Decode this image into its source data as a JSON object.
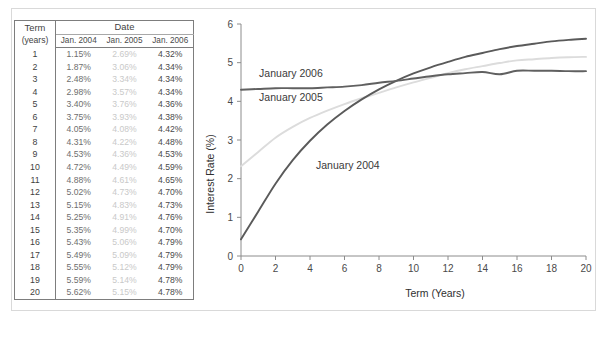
{
  "figure": {
    "border_color": "#d9d9d9",
    "background": "#ffffff"
  },
  "table": {
    "header": {
      "term_line1": "Term",
      "term_line2": "(years)",
      "date_group": "Date",
      "columns": [
        "Jan. 2004",
        "Jan. 2005",
        "Jan. 2006"
      ]
    },
    "rows": [
      {
        "term": "1",
        "v2004": "1.15%",
        "v2005": "2.69%",
        "v2006": "4.32%"
      },
      {
        "term": "2",
        "v2004": "1.87%",
        "v2005": "3.06%",
        "v2006": "4.34%"
      },
      {
        "term": "3",
        "v2004": "2.48%",
        "v2005": "3.34%",
        "v2006": "4.34%"
      },
      {
        "term": "4",
        "v2004": "2.98%",
        "v2005": "3.57%",
        "v2006": "4.34%"
      },
      {
        "term": "5",
        "v2004": "3.40%",
        "v2005": "3.76%",
        "v2006": "4.36%"
      },
      {
        "term": "6",
        "v2004": "3.75%",
        "v2005": "3.93%",
        "v2006": "4.38%"
      },
      {
        "term": "7",
        "v2004": "4.05%",
        "v2005": "4.08%",
        "v2006": "4.42%"
      },
      {
        "term": "8",
        "v2004": "4.31%",
        "v2005": "4.22%",
        "v2006": "4.48%"
      },
      {
        "term": "9",
        "v2004": "4.53%",
        "v2005": "4.36%",
        "v2006": "4.53%"
      },
      {
        "term": "10",
        "v2004": "4.72%",
        "v2005": "4.49%",
        "v2006": "4.59%"
      },
      {
        "term": "11",
        "v2004": "4.88%",
        "v2005": "4.61%",
        "v2006": "4.65%"
      },
      {
        "term": "12",
        "v2004": "5.02%",
        "v2005": "4.73%",
        "v2006": "4.70%"
      },
      {
        "term": "13",
        "v2004": "5.15%",
        "v2005": "4.83%",
        "v2006": "4.73%"
      },
      {
        "term": "14",
        "v2004": "5.25%",
        "v2005": "4.91%",
        "v2006": "4.76%"
      },
      {
        "term": "15",
        "v2004": "5.35%",
        "v2005": "4.99%",
        "v2006": "4.70%"
      },
      {
        "term": "16",
        "v2004": "5.43%",
        "v2005": "5.06%",
        "v2006": "4.79%"
      },
      {
        "term": "17",
        "v2004": "5.49%",
        "v2005": "5.09%",
        "v2006": "4.79%"
      },
      {
        "term": "18",
        "v2004": "5.55%",
        "v2005": "5.12%",
        "v2006": "4.79%"
      },
      {
        "term": "19",
        "v2004": "5.59%",
        "v2005": "5.14%",
        "v2006": "4.78%"
      },
      {
        "term": "20",
        "v2004": "5.62%",
        "v2005": "5.15%",
        "v2006": "4.78%"
      }
    ],
    "colors": {
      "term": "#3f3f3f",
      "v2004": "#6e6e6e",
      "v2005": "#c9c9c9",
      "v2006": "#4a4a4a",
      "rule": "#7d7d7d"
    }
  },
  "chart_data": {
    "type": "line",
    "title": "",
    "xlabel": "Term (Years)",
    "ylabel": "Interest Rate (%)",
    "xlim": [
      0,
      20
    ],
    "ylim": [
      0,
      6
    ],
    "xticks": [
      0,
      2,
      4,
      6,
      8,
      10,
      12,
      14,
      16,
      18,
      20
    ],
    "xtick_labels": [
      "0",
      "2",
      "4",
      "6",
      "8",
      "10",
      "12",
      "14",
      "16",
      "18",
      "20"
    ],
    "yticks": [
      0,
      1,
      2,
      3,
      4,
      5,
      6
    ],
    "ytick_labels": [
      "0",
      "1",
      "2",
      "3",
      "4",
      "5",
      "6"
    ],
    "x": [
      1,
      2,
      3,
      4,
      5,
      6,
      7,
      8,
      9,
      10,
      11,
      12,
      13,
      14,
      15,
      16,
      17,
      18,
      19,
      20
    ],
    "grid": false,
    "legend": "inline-annotations",
    "series": [
      {
        "name": "January 2004",
        "color": "#5a5a5a",
        "label": "January 2004",
        "label_x": 4.35,
        "label_y": 2.25,
        "values": [
          1.15,
          1.87,
          2.48,
          2.98,
          3.4,
          3.75,
          4.05,
          4.31,
          4.53,
          4.72,
          4.88,
          5.02,
          5.15,
          5.25,
          5.35,
          5.43,
          5.49,
          5.55,
          5.59,
          5.62
        ]
      },
      {
        "name": "January 2005",
        "color": "#dcdcdc",
        "label": "January 2005",
        "label_x": 1.05,
        "label_y": 4.02,
        "values": [
          2.69,
          3.06,
          3.34,
          3.57,
          3.76,
          3.93,
          4.08,
          4.22,
          4.36,
          4.49,
          4.61,
          4.73,
          4.83,
          4.91,
          4.99,
          5.06,
          5.09,
          5.12,
          5.14,
          5.15
        ]
      },
      {
        "name": "January 2006",
        "color": "#606060",
        "label": "January 2006",
        "label_x": 1.05,
        "label_y": 4.62,
        "values": [
          4.32,
          4.34,
          4.34,
          4.34,
          4.36,
          4.38,
          4.42,
          4.48,
          4.53,
          4.59,
          4.65,
          4.7,
          4.73,
          4.76,
          4.7,
          4.79,
          4.79,
          4.79,
          4.78,
          4.78
        ]
      }
    ]
  }
}
